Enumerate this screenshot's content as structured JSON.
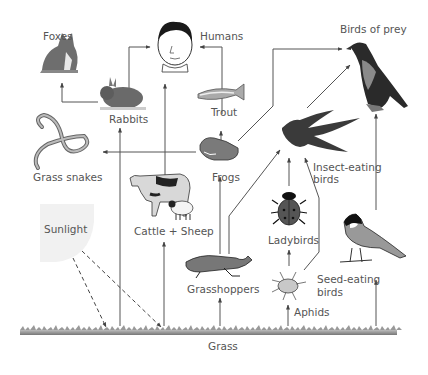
{
  "diagram": {
    "type": "food-web",
    "organisms": {
      "foxes": "Foxes",
      "humans": "Humans",
      "birds_of_prey": "Birds of prey",
      "rabbits": "Rabbits",
      "trout": "Trout",
      "grass_snakes": "Grass snakes",
      "frogs": "Frogs",
      "insect_eating_birds_1": "Insect-eating",
      "insect_eating_birds_2": "birds",
      "cattle_sheep": "Cattle + Sheep",
      "ladybirds": "Ladybirds",
      "sunlight": "Sunlight",
      "seed_eating_birds_1": "Seed-eating",
      "seed_eating_birds_2": "birds",
      "grasshoppers": "Grasshoppers",
      "aphids": "Aphids",
      "grass": "Grass"
    },
    "links": [
      {
        "from": "Grass",
        "to": "Rabbits"
      },
      {
        "from": "Grass",
        "to": "Cattle + Sheep"
      },
      {
        "from": "Grass",
        "to": "Grasshoppers"
      },
      {
        "from": "Grass",
        "to": "Aphids"
      },
      {
        "from": "Grass",
        "to": "Seed-eating birds"
      },
      {
        "from": "Sunlight",
        "to": "Grass",
        "style": "dashed"
      },
      {
        "from": "Rabbits",
        "to": "Foxes"
      },
      {
        "from": "Rabbits",
        "to": "Humans"
      },
      {
        "from": "Cattle + Sheep",
        "to": "Humans"
      },
      {
        "from": "Trout",
        "to": "Humans"
      },
      {
        "from": "Frogs",
        "to": "Trout"
      },
      {
        "from": "Frogs",
        "to": "Grass snakes"
      },
      {
        "from": "Frogs",
        "to": "Birds of prey"
      },
      {
        "from": "Grasshoppers",
        "to": "Frogs"
      },
      {
        "from": "Grasshoppers",
        "to": "Insect-eating birds"
      },
      {
        "from": "Ladybirds",
        "to": "Insect-eating birds"
      },
      {
        "from": "Aphids",
        "to": "Ladybirds"
      },
      {
        "from": "Aphids",
        "to": "Insect-eating birds"
      },
      {
        "from": "Insect-eating birds",
        "to": "Birds of prey"
      },
      {
        "from": "Seed-eating birds",
        "to": "Birds of prey"
      }
    ]
  }
}
